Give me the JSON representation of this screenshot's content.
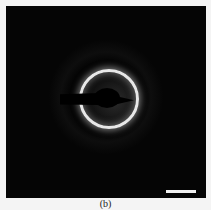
{
  "figure": {
    "caption": "(b)",
    "scale_bar": {
      "color": "#f0f0f0"
    },
    "colors": {
      "background": "#050505",
      "ring": "#e8e8e8",
      "page": "#f4f4f4"
    }
  }
}
